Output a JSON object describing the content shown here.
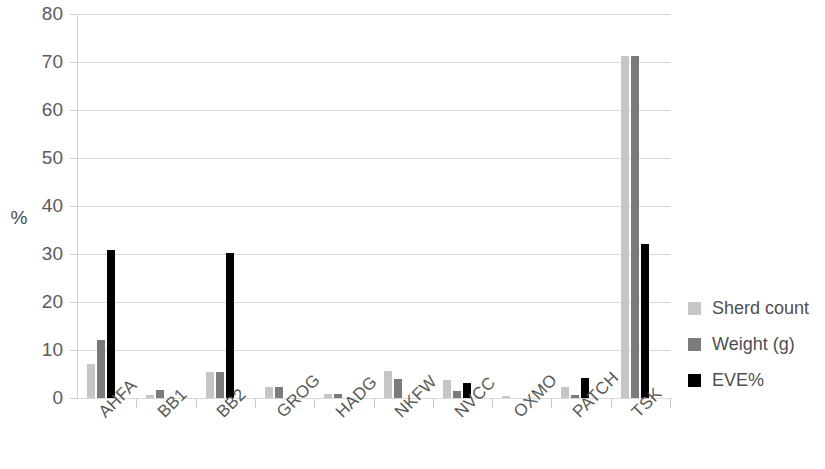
{
  "chart_data": {
    "type": "bar",
    "title": "",
    "xlabel": "",
    "ylabel": "%",
    "ylim": [
      0,
      80
    ],
    "yticks": [
      0,
      10,
      20,
      30,
      40,
      50,
      60,
      70,
      80
    ],
    "grid": true,
    "legend_position": "right",
    "categories": [
      "AHFA",
      "BB1",
      "BB2",
      "GROG",
      "HADG",
      "NKFW",
      "NVCC",
      "OXMO",
      "PATCH",
      "TSK"
    ],
    "series": [
      {
        "name": "Sherd count",
        "color": "#c6c6c6",
        "values": [
          7.0,
          0.6,
          5.5,
          2.3,
          0.8,
          5.7,
          3.8,
          0.5,
          2.2,
          71.3
        ]
      },
      {
        "name": "Weight (g)",
        "color": "#7b7b7b",
        "values": [
          12.0,
          1.6,
          5.5,
          2.3,
          0.8,
          3.9,
          1.5,
          0.0,
          0.7,
          71.3
        ]
      },
      {
        "name": "EVE%",
        "color": "#000000",
        "values": [
          30.8,
          0.0,
          30.2,
          0.0,
          0.0,
          0.0,
          3.1,
          0.0,
          4.2,
          32.0
        ]
      }
    ]
  }
}
